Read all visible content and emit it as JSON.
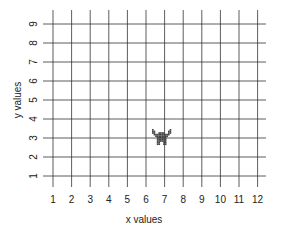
{
  "chart_data": {
    "type": "scatter",
    "title": "",
    "xlabel": "x values",
    "ylabel": "y values",
    "xlim": [
      1,
      12
    ],
    "ylim": [
      1,
      9
    ],
    "x_ticks": [
      1,
      2,
      3,
      4,
      5,
      6,
      7,
      8,
      9,
      10,
      11,
      12
    ],
    "y_ticks": [
      1,
      2,
      3,
      4,
      5,
      6,
      7,
      8,
      9
    ],
    "grid": true,
    "points": [
      {
        "x": 7,
        "y": 3,
        "marker": "pixel-monster-sprite",
        "color": "#444444"
      }
    ]
  },
  "colors": {
    "grid": "#333333",
    "text": "#222222",
    "sprite": "#444444",
    "background": "#ffffff"
  }
}
